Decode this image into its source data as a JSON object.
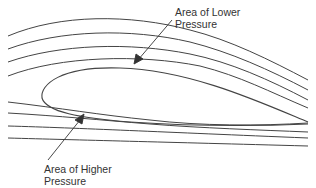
{
  "diagram": {
    "type": "airfoil-streamlines",
    "labels": {
      "lower": {
        "line1": "Area of Lower",
        "line2": "Pressure"
      },
      "higher": {
        "line1": "Area of Higher",
        "line2": "Pressure"
      }
    },
    "colors": {
      "stroke": "#444444",
      "text": "#333333",
      "background": "#ffffff"
    }
  }
}
